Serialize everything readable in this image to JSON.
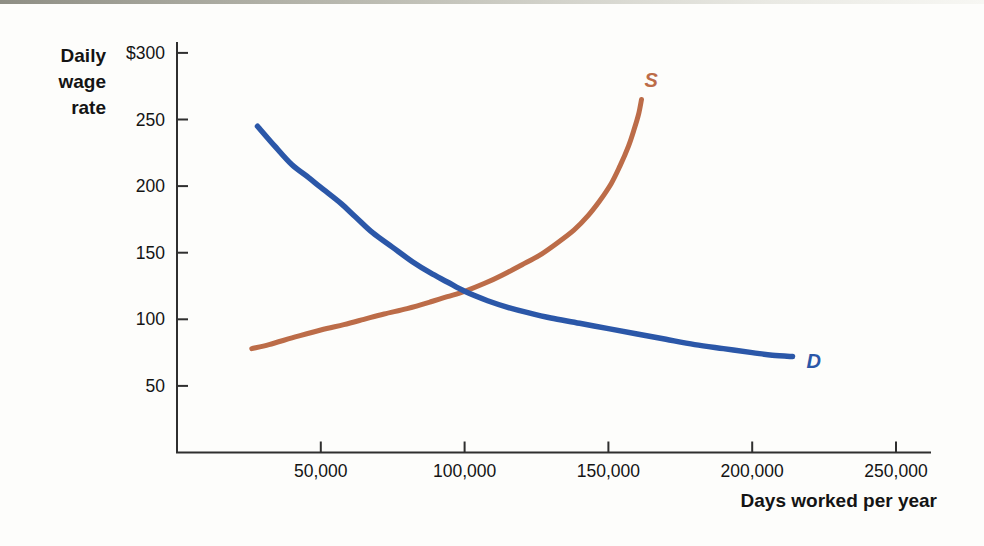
{
  "page": {
    "background_color": "#fdfdfb",
    "scan_edge_color": "#8e8e84"
  },
  "chart_data": {
    "type": "line",
    "title": "",
    "xlabel": "Days worked per year",
    "ylabel": "Daily wage rate",
    "ylabel_lines": [
      "Daily",
      "wage",
      "rate"
    ],
    "x_ticks": [
      50000,
      100000,
      150000,
      200000,
      250000
    ],
    "x_tick_labels": [
      "50,000",
      "100,000",
      "150,000",
      "200,000",
      "250,000"
    ],
    "y_ticks": [
      300,
      250,
      200,
      150,
      100,
      50
    ],
    "y_tick_labels": [
      "$300",
      "250",
      "200",
      "150",
      "100",
      "50"
    ],
    "xlim": [
      0,
      262000
    ],
    "ylim": [
      0,
      307
    ],
    "grid": false,
    "legend": "inline-curve-end-labels",
    "axis_color": "#2f2f2f",
    "text_color": "#141414",
    "intersection_note": "curves cross near x=100,000 at wage 120",
    "series": [
      {
        "name": "S",
        "label": "S",
        "role": "labor-supply-curve",
        "color": "#bc6c48",
        "points": [
          [
            26000,
            78
          ],
          [
            32000,
            81
          ],
          [
            40000,
            86
          ],
          [
            50000,
            92
          ],
          [
            58000,
            96
          ],
          [
            65000,
            100
          ],
          [
            72000,
            104
          ],
          [
            80000,
            108
          ],
          [
            88000,
            113
          ],
          [
            94000,
            117
          ],
          [
            100000,
            121
          ],
          [
            107000,
            127
          ],
          [
            113000,
            133
          ],
          [
            120000,
            141
          ],
          [
            126000,
            148
          ],
          [
            132000,
            157
          ],
          [
            138000,
            167
          ],
          [
            143000,
            178
          ],
          [
            147000,
            189
          ],
          [
            151000,
            202
          ],
          [
            154000,
            215
          ],
          [
            157000,
            230
          ],
          [
            159000,
            243
          ],
          [
            160500,
            254
          ],
          [
            161500,
            265
          ]
        ]
      },
      {
        "name": "D",
        "label": "D",
        "role": "labor-demand-curve",
        "color": "#2b57a8",
        "points": [
          [
            28000,
            245
          ],
          [
            34000,
            230
          ],
          [
            40000,
            216
          ],
          [
            46000,
            206
          ],
          [
            50000,
            199
          ],
          [
            57000,
            187
          ],
          [
            62000,
            177
          ],
          [
            68000,
            165
          ],
          [
            75000,
            154
          ],
          [
            82000,
            143
          ],
          [
            88000,
            135
          ],
          [
            94000,
            128
          ],
          [
            100000,
            121
          ],
          [
            108000,
            114
          ],
          [
            115000,
            109
          ],
          [
            122000,
            105
          ],
          [
            130000,
            101
          ],
          [
            140000,
            97
          ],
          [
            150000,
            93
          ],
          [
            160000,
            89
          ],
          [
            170000,
            85
          ],
          [
            180000,
            81
          ],
          [
            190000,
            78
          ],
          [
            200000,
            75
          ],
          [
            207000,
            73
          ],
          [
            214000,
            72
          ]
        ]
      }
    ]
  }
}
